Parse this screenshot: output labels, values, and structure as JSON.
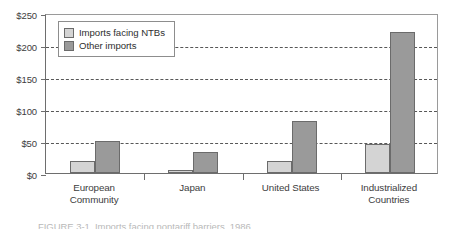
{
  "chart_data": {
    "type": "bar",
    "title": "",
    "xlabel": "",
    "ylabel": "",
    "ylim": [
      0,
      250
    ],
    "yticks": [
      0,
      50,
      100,
      150,
      200,
      250
    ],
    "ytick_labels": [
      "$0",
      "$50",
      "$100",
      "$150",
      "$200",
      "$250"
    ],
    "grid": "horizontal-dashed",
    "legend_position": "upper-left-inside",
    "categories": [
      "European Community",
      "Japan",
      "United States",
      "Industrialized Countries"
    ],
    "category_label_lines": [
      [
        "European",
        "Community"
      ],
      [
        "Japan"
      ],
      [
        "United States"
      ],
      [
        "Industrialized",
        "Countries"
      ]
    ],
    "series": [
      {
        "name": "Imports facing NTBs",
        "color": "#d4d4d4",
        "values": [
          19,
          4,
          18,
          46
        ]
      },
      {
        "name": "Other imports",
        "color": "#9a9a9a",
        "values": [
          50,
          33,
          82,
          220
        ]
      }
    ]
  },
  "legend": {
    "items": [
      {
        "label": "Imports facing NTBs",
        "swatch": "light"
      },
      {
        "label": "Other imports",
        "swatch": "dark"
      }
    ]
  },
  "caption": {
    "text": "FIGURE 3-1. Imports facing nontariff barriers, 1986"
  }
}
